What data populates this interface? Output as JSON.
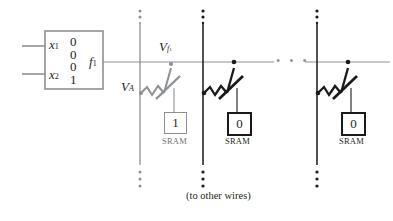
{
  "figure": {
    "caption": "(to other wires)",
    "colors": {
      "gray": "#8d9096",
      "black": "#1a1a1a",
      "ink": "#231f20",
      "background": "#ffffff"
    }
  },
  "lut": {
    "inputs": [
      {
        "name": "x",
        "subscript": "1"
      },
      {
        "name": "x",
        "subscript": "2"
      }
    ],
    "truth_table": [
      "0",
      "0",
      "0",
      "1"
    ],
    "output": {
      "name": "f",
      "subscript": "1"
    }
  },
  "wires": {
    "horizontal_label": {
      "name": "V",
      "subscript": "f",
      "subsubscript": "1"
    },
    "vertical_label": {
      "name": "V",
      "subscript": "A"
    },
    "ellipsis_dots": "• • •"
  },
  "switches": [
    {
      "id": "switch-1",
      "state": "on",
      "style": "gray",
      "sram": {
        "value": "1",
        "label": "SRAM",
        "style": "gray"
      }
    },
    {
      "id": "switch-2",
      "state": "off",
      "style": "black",
      "sram": {
        "value": "0",
        "label": "SRAM",
        "style": "black"
      }
    },
    {
      "id": "switch-3",
      "state": "off",
      "style": "black",
      "sram": {
        "value": "0",
        "label": "SRAM",
        "style": "black"
      }
    }
  ]
}
